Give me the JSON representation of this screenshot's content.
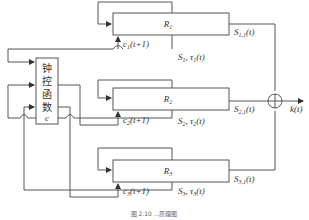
{
  "diagram": {
    "controller": {
      "chars": [
        "钟",
        "控",
        "函",
        "数"
      ],
      "symbol": "c"
    },
    "blocks": [
      {
        "label": "R",
        "sub": "1",
        "input_label": "c",
        "input_sub": "1",
        "input_arg": "(t+1)",
        "state_label": "S",
        "state_sub": "1",
        "state_sep": ", ",
        "tau": "τ",
        "tau_sub": "1",
        "tau_arg": "(t)",
        "out_label": "S",
        "out_sub": "1,1",
        "out_arg": "(t)"
      },
      {
        "label": "R",
        "sub": "2",
        "input_label": "c",
        "input_sub": "2",
        "input_arg": "(t+1)",
        "state_label": "S",
        "state_sub": "2",
        "state_sep": ", ",
        "tau": "τ",
        "tau_sub": "2",
        "tau_arg": "(t)",
        "out_label": "S",
        "out_sub": "2,1",
        "out_arg": "(t)"
      },
      {
        "label": "R",
        "sub": "3",
        "input_label": "c",
        "input_sub": "3",
        "input_arg": "(t+1)",
        "state_label": "S",
        "state_sub": "3",
        "state_sep": ", ",
        "tau": "τ",
        "tau_sub": "3",
        "tau_arg": "(t)",
        "out_label": "S",
        "out_sub": "3,1",
        "out_arg": "(t)"
      }
    ],
    "sum_symbol": "summing-junction",
    "output": {
      "label": "k",
      "arg": "(t)"
    },
    "caption": "图 2.10   ...原理图"
  }
}
